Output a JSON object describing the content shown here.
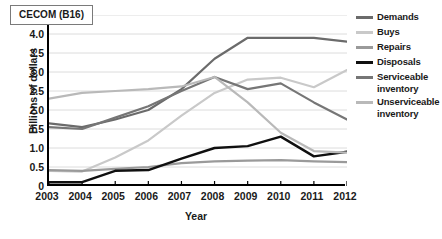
{
  "chart_data": {
    "type": "line",
    "title": "CECOM (B16)",
    "xlabel": "Year",
    "ylabel": "Billions of dollars",
    "categories": [
      2003,
      2004,
      2005,
      2006,
      2007,
      2008,
      2009,
      2010,
      2011,
      2012
    ],
    "x_tick_labels": [
      "2003",
      "2004",
      "2005",
      "2006",
      "2007",
      "2008",
      "2009",
      "2010",
      "2011",
      "2012"
    ],
    "y_tick_labels": [
      "4.5",
      "4.0",
      "3.5",
      "3.0",
      "2.5",
      "2.0",
      "1.5",
      "1.0",
      "0.5",
      "0"
    ],
    "y_tick_values": [
      4.5,
      4.0,
      3.5,
      3.0,
      2.5,
      2.0,
      1.5,
      1.0,
      0.5,
      0
    ],
    "ylim": [
      0,
      4.5
    ],
    "xlim": [
      2003,
      2012
    ],
    "grid": true,
    "grid_axis": "y",
    "legend_position": "right",
    "series": [
      {
        "name": "Demands",
        "color": "#6b6b6b",
        "width": 2.2,
        "values": [
          1.65,
          1.55,
          1.75,
          2.0,
          2.55,
          3.35,
          3.9,
          3.9,
          3.9,
          3.8
        ]
      },
      {
        "name": "Buys",
        "color": "#c9c9c9",
        "width": 2.2,
        "values": [
          0.4,
          0.38,
          0.75,
          1.2,
          1.85,
          2.45,
          2.8,
          2.85,
          2.6,
          3.05
        ]
      },
      {
        "name": "Repairs",
        "color": "#9a9a9a",
        "width": 2.2,
        "values": [
          0.42,
          0.4,
          0.45,
          0.5,
          0.6,
          0.65,
          0.67,
          0.68,
          0.65,
          0.63
        ]
      },
      {
        "name": "Disposals",
        "color": "#101010",
        "width": 2.4,
        "values": [
          0.1,
          0.1,
          0.4,
          0.42,
          0.72,
          1.0,
          1.05,
          1.3,
          0.78,
          0.9
        ]
      },
      {
        "name": "Serviceable inventory",
        "color": "#767676",
        "width": 2.2,
        "values": [
          1.55,
          1.5,
          1.8,
          2.1,
          2.5,
          2.87,
          2.55,
          2.7,
          2.2,
          1.75
        ]
      },
      {
        "name": "Unserviceable inventory",
        "color": "#b9b9b9",
        "width": 2.2,
        "values": [
          2.3,
          2.45,
          2.5,
          2.55,
          2.62,
          2.87,
          2.2,
          1.4,
          0.92,
          0.88
        ]
      }
    ],
    "legend": [
      {
        "label": "Demands",
        "color": "#6b6b6b"
      },
      {
        "label": "Buys",
        "color": "#c9c9c9"
      },
      {
        "label": "Repairs",
        "color": "#9a9a9a"
      },
      {
        "label": "Disposals",
        "color": "#101010"
      },
      {
        "label": "Serviceable inventory",
        "color": "#767676"
      },
      {
        "label": "Unserviceable inventory",
        "color": "#b9b9b9"
      }
    ]
  }
}
